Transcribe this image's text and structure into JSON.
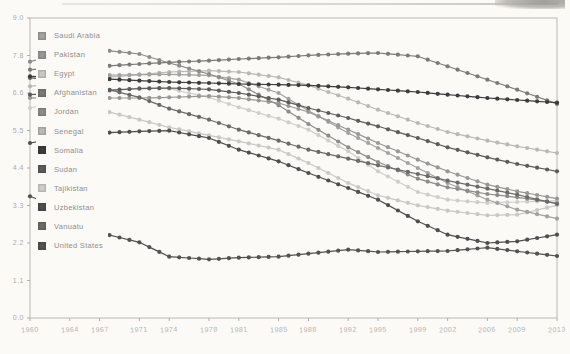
{
  "figure": {
    "background": "#fbfaf7",
    "frame_color": "#b9b8b2",
    "tick_color": "#b0afaa"
  },
  "chart_data": {
    "type": "line",
    "title": "",
    "xlabel": "",
    "ylabel": "",
    "grid": false,
    "markers": "circle-every-year",
    "legend_position": "upper-left",
    "xlim": [
      1960,
      2013
    ],
    "ylim": [
      0,
      9
    ],
    "ytick_labels": [
      "9.0",
      "7.8",
      "6.6",
      "5.5",
      "4.4",
      "3.3",
      "2.2",
      "1.1",
      "0.0"
    ],
    "xtick_labels": [
      "1960",
      "1964",
      "1967",
      "1971",
      "1974",
      "1978",
      "1981",
      "1985",
      "1988",
      "1992",
      "1995",
      "1999",
      "2002",
      "2006",
      "2009",
      "2013"
    ],
    "anchor_years": [
      1960,
      1964,
      1967,
      1971,
      1974,
      1978,
      1981,
      1985,
      1988,
      1992,
      1995,
      1999,
      2002,
      2006,
      2009,
      2013
    ],
    "series": [
      {
        "name": "Saudi Arabia",
        "color": "#a2a2a0",
        "values": [
          7.22,
          7.26,
          7.28,
          7.3,
          7.31,
          7.28,
          7.15,
          6.75,
          6.22,
          5.55,
          5.1,
          4.5,
          4.05,
          3.55,
          3.25,
          2.98
        ]
      },
      {
        "name": "Pakistan",
        "color": "#989896",
        "values": [
          6.6,
          6.6,
          6.6,
          6.6,
          6.62,
          6.66,
          6.6,
          6.45,
          6.18,
          5.65,
          5.25,
          4.75,
          4.4,
          4.0,
          3.8,
          3.58
        ]
      },
      {
        "name": "Egypt",
        "color": "#c8c8c4",
        "values": [
          6.63,
          6.44,
          6.25,
          5.95,
          5.72,
          5.48,
          5.3,
          5.05,
          4.65,
          4.05,
          3.68,
          3.38,
          3.22,
          3.08,
          3.1,
          3.38
        ]
      },
      {
        "name": "Afghanistan",
        "color": "#7a7a78",
        "values": [
          7.45,
          7.5,
          7.55,
          7.62,
          7.67,
          7.72,
          7.77,
          7.82,
          7.88,
          7.93,
          7.95,
          7.85,
          7.55,
          7.15,
          6.85,
          6.42
        ]
      },
      {
        "name": "Jordan",
        "color": "#8c8c8a",
        "values": [
          7.69,
          7.98,
          8.05,
          7.92,
          7.65,
          7.32,
          7.02,
          6.38,
          5.82,
          5.12,
          4.68,
          4.18,
          3.92,
          3.72,
          3.62,
          3.45
        ]
      },
      {
        "name": "Senegal",
        "color": "#b8b8b4",
        "values": [
          6.95,
          7.1,
          7.2,
          7.3,
          7.38,
          7.42,
          7.38,
          7.22,
          6.98,
          6.58,
          6.25,
          5.85,
          5.58,
          5.32,
          5.15,
          4.95
        ]
      },
      {
        "name": "Somalia",
        "color": "#3c3c3c",
        "values": [
          7.25,
          7.22,
          7.18,
          7.12,
          7.08,
          7.05,
          7.02,
          7.0,
          6.98,
          6.92,
          6.86,
          6.78,
          6.7,
          6.6,
          6.54,
          6.46
        ]
      },
      {
        "name": "Sudan",
        "color": "#5c5c5a",
        "values": [
          6.7,
          6.76,
          6.82,
          6.88,
          6.9,
          6.86,
          6.75,
          6.55,
          6.3,
          6.0,
          5.75,
          5.4,
          5.12,
          4.82,
          4.62,
          4.4
        ]
      },
      {
        "name": "Tajikistan",
        "color": "#cececa",
        "values": [
          6.3,
          6.58,
          6.78,
          6.9,
          6.88,
          6.62,
          6.32,
          5.98,
          5.65,
          5.0,
          4.4,
          3.78,
          3.55,
          3.45,
          3.48,
          3.52
        ]
      },
      {
        "name": "Uzbekistan",
        "color": "#4e4e4e",
        "values": [
          5.25,
          5.45,
          5.55,
          5.6,
          5.62,
          5.4,
          5.05,
          4.7,
          4.35,
          3.9,
          3.55,
          2.9,
          2.5,
          2.25,
          2.3,
          2.5
        ]
      },
      {
        "name": "Vanuatu",
        "color": "#6a6a68",
        "values": [
          7.2,
          7.08,
          6.92,
          6.62,
          6.28,
          5.95,
          5.65,
          5.32,
          5.05,
          4.78,
          4.58,
          4.32,
          4.12,
          3.88,
          3.7,
          3.42
        ]
      },
      {
        "name": "United States",
        "color": "#525250",
        "values": [
          3.65,
          3.19,
          2.56,
          2.27,
          1.84,
          1.76,
          1.81,
          1.84,
          1.93,
          2.05,
          1.98,
          2.0,
          2.01,
          2.11,
          2.0,
          1.86
        ]
      }
    ]
  }
}
